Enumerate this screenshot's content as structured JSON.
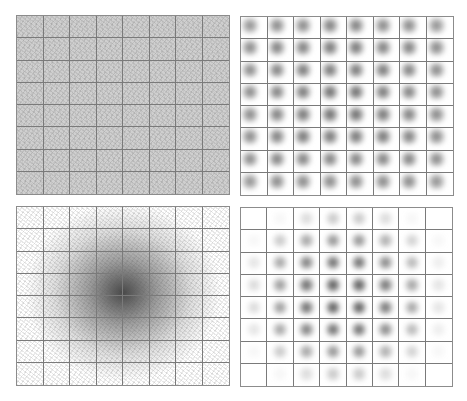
{
  "figure": {
    "panels": [
      {
        "id": "top-left",
        "kind": "trajectory-density-uniform",
        "grid": [
          8,
          8
        ]
      },
      {
        "id": "top-right",
        "kind": "per-cell-heatmap-uniform",
        "grid": [
          8,
          8
        ]
      },
      {
        "id": "bottom-left",
        "kind": "trajectory-density-centered",
        "grid": [
          8,
          8
        ]
      },
      {
        "id": "bottom-right",
        "kind": "per-cell-heatmap-centered",
        "grid": [
          8,
          8
        ]
      }
    ],
    "colors": {
      "grid_line": "#7a7a7a",
      "ink": "#3a3a3a",
      "background": "#ffffff"
    }
  },
  "chart_data": [
    {
      "type": "heatmap",
      "title": "",
      "description": "Top-left: dense uniform overlapping trajectories over an 8x8 grid",
      "rows": 8,
      "cols": 8,
      "values": [
        [
          0.55,
          0.6,
          0.6,
          0.6,
          0.6,
          0.6,
          0.6,
          0.55
        ],
        [
          0.6,
          0.65,
          0.65,
          0.65,
          0.65,
          0.65,
          0.65,
          0.6
        ],
        [
          0.6,
          0.65,
          0.65,
          0.65,
          0.65,
          0.65,
          0.65,
          0.6
        ],
        [
          0.6,
          0.65,
          0.65,
          0.65,
          0.65,
          0.65,
          0.65,
          0.6
        ],
        [
          0.6,
          0.65,
          0.65,
          0.65,
          0.65,
          0.65,
          0.65,
          0.6
        ],
        [
          0.6,
          0.65,
          0.65,
          0.65,
          0.65,
          0.65,
          0.65,
          0.6
        ],
        [
          0.6,
          0.65,
          0.65,
          0.65,
          0.65,
          0.65,
          0.65,
          0.6
        ],
        [
          0.55,
          0.6,
          0.6,
          0.6,
          0.6,
          0.6,
          0.6,
          0.55
        ]
      ],
      "grid": true
    },
    {
      "type": "heatmap",
      "title": "",
      "description": "Top-right: per-cell local density blobs, roughly uniform intensity",
      "rows": 8,
      "cols": 8,
      "values": [
        [
          0.6,
          0.65,
          0.65,
          0.7,
          0.7,
          0.65,
          0.65,
          0.6
        ],
        [
          0.65,
          0.7,
          0.7,
          0.75,
          0.75,
          0.7,
          0.7,
          0.65
        ],
        [
          0.65,
          0.7,
          0.75,
          0.75,
          0.75,
          0.75,
          0.7,
          0.65
        ],
        [
          0.65,
          0.7,
          0.75,
          0.8,
          0.8,
          0.75,
          0.7,
          0.65
        ],
        [
          0.65,
          0.7,
          0.75,
          0.8,
          0.8,
          0.75,
          0.7,
          0.65
        ],
        [
          0.65,
          0.7,
          0.75,
          0.75,
          0.75,
          0.75,
          0.7,
          0.65
        ],
        [
          0.65,
          0.7,
          0.7,
          0.7,
          0.7,
          0.7,
          0.7,
          0.65
        ],
        [
          0.6,
          0.65,
          0.65,
          0.65,
          0.65,
          0.65,
          0.65,
          0.6
        ]
      ],
      "grid": true
    },
    {
      "type": "heatmap",
      "title": "",
      "description": "Bottom-left: trajectories radiating from center, densest at middle",
      "rows": 8,
      "cols": 8,
      "values": [
        [
          0.0,
          0.05,
          0.15,
          0.25,
          0.25,
          0.15,
          0.05,
          0.0
        ],
        [
          0.05,
          0.2,
          0.35,
          0.45,
          0.45,
          0.35,
          0.2,
          0.05
        ],
        [
          0.1,
          0.3,
          0.55,
          0.65,
          0.65,
          0.55,
          0.3,
          0.1
        ],
        [
          0.15,
          0.4,
          0.65,
          0.85,
          0.85,
          0.65,
          0.4,
          0.15
        ],
        [
          0.15,
          0.4,
          0.65,
          0.85,
          0.85,
          0.65,
          0.4,
          0.15
        ],
        [
          0.1,
          0.3,
          0.55,
          0.65,
          0.65,
          0.55,
          0.3,
          0.1
        ],
        [
          0.05,
          0.2,
          0.35,
          0.45,
          0.45,
          0.35,
          0.2,
          0.05
        ],
        [
          0.0,
          0.05,
          0.15,
          0.25,
          0.25,
          0.15,
          0.05,
          0.0
        ]
      ],
      "grid": true
    },
    {
      "type": "heatmap",
      "title": "",
      "description": "Bottom-right: per-cell blobs, intensity peaking at center cells",
      "rows": 8,
      "cols": 8,
      "values": [
        [
          0.0,
          0.05,
          0.2,
          0.3,
          0.3,
          0.2,
          0.05,
          0.0
        ],
        [
          0.05,
          0.3,
          0.5,
          0.6,
          0.6,
          0.45,
          0.25,
          0.05
        ],
        [
          0.15,
          0.5,
          0.7,
          0.8,
          0.8,
          0.65,
          0.4,
          0.1
        ],
        [
          0.2,
          0.55,
          0.8,
          0.9,
          0.9,
          0.75,
          0.5,
          0.15
        ],
        [
          0.2,
          0.55,
          0.8,
          0.9,
          0.9,
          0.75,
          0.5,
          0.15
        ],
        [
          0.15,
          0.5,
          0.7,
          0.8,
          0.8,
          0.65,
          0.4,
          0.1
        ],
        [
          0.05,
          0.3,
          0.5,
          0.6,
          0.6,
          0.45,
          0.25,
          0.05
        ],
        [
          0.0,
          0.05,
          0.2,
          0.3,
          0.3,
          0.2,
          0.05,
          0.0
        ]
      ],
      "grid": true
    }
  ]
}
